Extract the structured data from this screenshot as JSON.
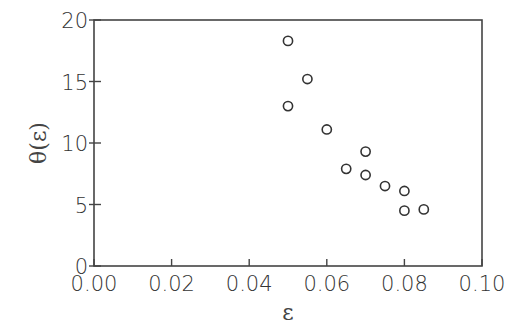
{
  "chart_data": {
    "type": "scatter",
    "title": "",
    "xlabel": "ε",
    "ylabel": "θ(ε)",
    "xlim": [
      0.0,
      0.1
    ],
    "ylim": [
      0,
      20
    ],
    "xticks": [
      0.0,
      0.02,
      0.04,
      0.06,
      0.08,
      0.1
    ],
    "xtick_labels": [
      "0.00",
      "0.02",
      "0.04",
      "0.06",
      "0.08",
      "0.10"
    ],
    "yticks": [
      0,
      5,
      10,
      15,
      20
    ],
    "ytick_labels": [
      "0",
      "5",
      "10",
      "15",
      "20"
    ],
    "grid": false,
    "legend": null,
    "marker": "open-circle",
    "series": [
      {
        "name": "theta",
        "points": [
          {
            "x": 0.05,
            "y": 18.3
          },
          {
            "x": 0.055,
            "y": 15.2
          },
          {
            "x": 0.05,
            "y": 13.0
          },
          {
            "x": 0.06,
            "y": 11.1
          },
          {
            "x": 0.065,
            "y": 7.9
          },
          {
            "x": 0.07,
            "y": 9.3
          },
          {
            "x": 0.07,
            "y": 7.4
          },
          {
            "x": 0.075,
            "y": 6.5
          },
          {
            "x": 0.08,
            "y": 6.1
          },
          {
            "x": 0.08,
            "y": 4.5
          },
          {
            "x": 0.085,
            "y": 4.6
          }
        ]
      }
    ],
    "colors": {
      "axis": "#444444",
      "marker": "#333333",
      "background": "#ffffff"
    }
  }
}
